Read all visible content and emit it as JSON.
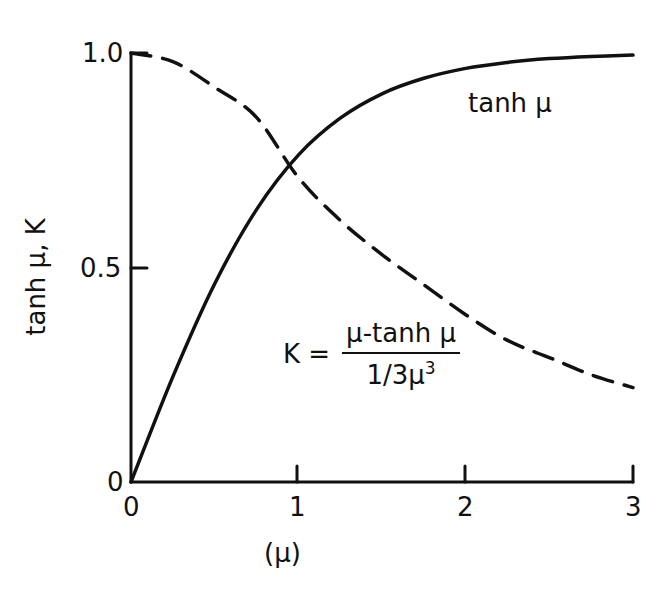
{
  "chart_data": {
    "type": "line",
    "title": "",
    "xlabel": "(μ)",
    "ylabel": "tanh μ,  K",
    "xlim": [
      0,
      3
    ],
    "ylim": [
      0,
      1.0
    ],
    "x_ticks": [
      "0",
      "1",
      "2",
      "3"
    ],
    "y_ticks": [
      "0",
      "0.5",
      "1.0"
    ],
    "grid": false,
    "legend": "inline annotations",
    "series": [
      {
        "name": "tanh μ",
        "style": "solid",
        "x": [
          0,
          0.25,
          0.5,
          0.75,
          1.0,
          1.25,
          1.5,
          1.75,
          2.0,
          2.25,
          2.5,
          2.75,
          3.0
        ],
        "y": [
          0,
          0.245,
          0.462,
          0.635,
          0.762,
          0.848,
          0.905,
          0.941,
          0.964,
          0.978,
          0.987,
          0.992,
          0.995
        ]
      },
      {
        "name": "K = (μ − tanh μ) / (1/3 μ³)",
        "style": "dashed",
        "x": [
          0,
          0.25,
          0.5,
          0.75,
          1.0,
          1.25,
          1.5,
          1.75,
          2.0,
          2.25,
          2.5,
          2.75,
          3.0
        ],
        "y": [
          1.0,
          0.98,
          0.92,
          0.85,
          0.71,
          0.61,
          0.53,
          0.46,
          0.39,
          0.33,
          0.29,
          0.25,
          0.22
        ]
      }
    ],
    "annotations": [
      {
        "text": "tanh μ",
        "near": [
          2.3,
          0.9
        ]
      },
      {
        "text": "K = (μ-tanh μ) / (1/3μ³)",
        "near": [
          1.5,
          0.3
        ]
      }
    ]
  },
  "labels": {
    "y_axis": "tanh μ,  K",
    "x_axis": "(μ)",
    "tanh_curve": "tanh μ",
    "k_eq": "K =",
    "k_num": "μ-tanh μ",
    "k_den": "1/3μ",
    "k_den_exp": "3",
    "tick_y_1": "1.0",
    "tick_y_05": "0.5",
    "tick_y_0": "0",
    "tick_x_0": "0",
    "tick_x_1": "1",
    "tick_x_2": "2",
    "tick_x_3": "3"
  },
  "style": {
    "ink": "#111111",
    "background": "#ffffff"
  }
}
